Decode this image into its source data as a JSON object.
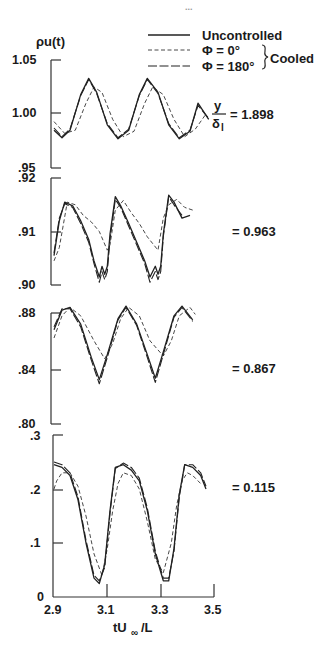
{
  "chart_data": {
    "type": "line",
    "page_mark": "...",
    "ylabel": "ρu(t)",
    "xlabel": "tU∞ /L",
    "x_ticks": [
      "2.9",
      "3.1",
      "3.3",
      "3.5"
    ],
    "xlim": [
      2.9,
      3.5
    ],
    "legend": {
      "items": [
        {
          "label": "Uncontrolled",
          "style": "solid"
        },
        {
          "label": "Φ = 0°",
          "style": "dashed"
        },
        {
          "label": "Φ = 180°",
          "style": "long-dash"
        }
      ],
      "group_label": "Cooled",
      "position": "top-right"
    },
    "panels": [
      {
        "annotation_prefix": "y/δ₁",
        "annotation": "= 1.898",
        "y_ticks": [
          "1.05",
          "1.00",
          ".95"
        ],
        "ylim": [
          0.95,
          1.05
        ],
        "series": [
          {
            "name": "Uncontrolled",
            "x": [
              2.9,
              2.93,
              2.96,
              3.0,
              3.03,
              3.06,
              3.1,
              3.14,
              3.18,
              3.22,
              3.25,
              3.29,
              3.33,
              3.37,
              3.41,
              3.44,
              3.48
            ],
            "y": [
              0.985,
              0.978,
              0.985,
              1.018,
              1.033,
              1.02,
              0.99,
              0.977,
              0.985,
              1.018,
              1.033,
              1.02,
              0.99,
              0.977,
              0.984,
              1.01,
              0.995
            ]
          },
          {
            "name": "Cooled Φ=0°",
            "x": [
              2.9,
              2.94,
              2.98,
              3.02,
              3.05,
              3.08,
              3.12,
              3.16,
              3.2,
              3.24,
              3.27,
              3.31,
              3.35,
              3.39,
              3.43,
              3.47
            ],
            "y": [
              0.993,
              0.982,
              0.985,
              1.01,
              1.025,
              1.02,
              0.995,
              0.979,
              0.984,
              1.01,
              1.025,
              1.018,
              0.995,
              0.979,
              0.986,
              1.0
            ]
          },
          {
            "name": "Cooled Φ=180°",
            "x": [
              2.9,
              2.93,
              2.96,
              3.0,
              3.03,
              3.06,
              3.1,
              3.14,
              3.18,
              3.22,
              3.25,
              3.29,
              3.33,
              3.37,
              3.41,
              3.44,
              3.48
            ],
            "y": [
              0.987,
              0.979,
              0.986,
              1.017,
              1.032,
              1.019,
              0.991,
              0.978,
              0.986,
              1.017,
              1.032,
              1.019,
              0.991,
              0.978,
              0.985,
              1.008,
              0.996
            ]
          }
        ]
      },
      {
        "annotation": "= 0.963",
        "y_ticks": [
          ".92",
          ".91",
          ".90"
        ],
        "ylim": [
          0.9,
          0.92
        ],
        "series": [
          {
            "name": "Uncontrolled",
            "x": [
              2.9,
              2.92,
              2.94,
              2.97,
              3.0,
              3.03,
              3.05,
              3.07,
              3.08,
              3.09,
              3.1,
              3.11,
              3.13,
              3.15,
              3.18,
              3.21,
              3.24,
              3.26,
              3.28,
              3.29,
              3.3,
              3.31,
              3.33,
              3.35,
              3.38,
              3.41
            ],
            "y": [
              0.9055,
              0.912,
              0.9155,
              0.9148,
              0.912,
              0.9085,
              0.9045,
              0.9015,
              0.9035,
              0.902,
              0.9035,
              0.9095,
              0.9165,
              0.9148,
              0.9115,
              0.908,
              0.9045,
              0.9015,
              0.9035,
              0.902,
              0.9035,
              0.9095,
              0.9168,
              0.9155,
              0.9125,
              0.913
            ]
          },
          {
            "name": "Cooled Φ=0°",
            "x": [
              2.9,
              2.92,
              2.95,
              2.98,
              3.01,
              3.04,
              3.07,
              3.1,
              3.11,
              3.13,
              3.16,
              3.19,
              3.22,
              3.25,
              3.29,
              3.31,
              3.33,
              3.36,
              3.39,
              3.42
            ],
            "y": [
              0.9045,
              0.907,
              0.9155,
              0.915,
              0.913,
              0.9118,
              0.91,
              0.9065,
              0.9075,
              0.914,
              0.9158,
              0.9135,
              0.9115,
              0.909,
              0.9065,
              0.9125,
              0.915,
              0.916,
              0.9145,
              0.914
            ]
          },
          {
            "name": "Cooled Φ=180°",
            "x": [
              2.9,
              2.92,
              2.94,
              2.97,
              3.0,
              3.03,
              3.05,
              3.07,
              3.08,
              3.09,
              3.1,
              3.11,
              3.13,
              3.15,
              3.18,
              3.21,
              3.24,
              3.26,
              3.28,
              3.29,
              3.3,
              3.31,
              3.33,
              3.35,
              3.38
            ],
            "y": [
              0.906,
              0.9125,
              0.9152,
              0.9145,
              0.9115,
              0.908,
              0.904,
              0.9005,
              0.9025,
              0.901,
              0.9025,
              0.9085,
              0.916,
              0.9145,
              0.911,
              0.9075,
              0.904,
              0.9005,
              0.9025,
              0.901,
              0.9025,
              0.909,
              0.9165,
              0.915,
              0.913
            ]
          }
        ]
      },
      {
        "annotation": "= 0.867",
        "y_ticks": [
          ".88",
          ".84",
          ".80"
        ],
        "ylim": [
          0.8,
          0.88
        ],
        "series": [
          {
            "name": "Uncontrolled",
            "x": [
              2.9,
              2.93,
              2.96,
              3.0,
              3.04,
              3.07,
              3.1,
              3.14,
              3.17,
              3.21,
              3.25,
              3.28,
              3.31,
              3.35,
              3.38,
              3.42
            ],
            "y": [
              0.868,
              0.882,
              0.884,
              0.872,
              0.848,
              0.832,
              0.85,
              0.876,
              0.885,
              0.872,
              0.85,
              0.833,
              0.852,
              0.878,
              0.885,
              0.875
            ]
          },
          {
            "name": "Cooled Φ=0°",
            "x": [
              2.9,
              2.93,
              2.96,
              3.0,
              3.05,
              3.09,
              3.12,
              3.15,
              3.18,
              3.22,
              3.26,
              3.31,
              3.34,
              3.37,
              3.41,
              3.43
            ],
            "y": [
              0.862,
              0.878,
              0.884,
              0.878,
              0.86,
              0.847,
              0.858,
              0.876,
              0.884,
              0.878,
              0.86,
              0.849,
              0.86,
              0.878,
              0.884,
              0.879
            ]
          },
          {
            "name": "Cooled Φ=180°",
            "x": [
              2.9,
              2.93,
              2.96,
              3.0,
              3.04,
              3.07,
              3.1,
              3.14,
              3.17,
              3.21,
              3.25,
              3.28,
              3.31,
              3.35,
              3.38,
              3.42
            ],
            "y": [
              0.87,
              0.883,
              0.883,
              0.87,
              0.846,
              0.829,
              0.848,
              0.875,
              0.884,
              0.871,
              0.848,
              0.83,
              0.85,
              0.877,
              0.884,
              0.874
            ]
          }
        ]
      },
      {
        "annotation": "= 0.115",
        "y_ticks": [
          ".3",
          ".2",
          ".1",
          "0"
        ],
        "ylim": [
          0.0,
          0.3
        ],
        "series": [
          {
            "name": "Uncontrolled",
            "x": [
              2.9,
              2.93,
              2.96,
              2.99,
              3.02,
              3.05,
              3.07,
              3.09,
              3.11,
              3.13,
              3.16,
              3.19,
              3.22,
              3.25,
              3.28,
              3.31,
              3.33,
              3.35,
              3.37,
              3.39,
              3.42,
              3.45,
              3.47
            ],
            "y": [
              0.245,
              0.24,
              0.225,
              0.18,
              0.1,
              0.035,
              0.025,
              0.06,
              0.16,
              0.24,
              0.245,
              0.235,
              0.215,
              0.16,
              0.08,
              0.03,
              0.03,
              0.09,
              0.19,
              0.245,
              0.24,
              0.225,
              0.2
            ]
          },
          {
            "name": "Cooled Φ=0°",
            "x": [
              2.9,
              2.91,
              2.93,
              2.96,
              2.99,
              3.02,
              3.05,
              3.08,
              3.1,
              3.12,
              3.14,
              3.16,
              3.19,
              3.22,
              3.25,
              3.28,
              3.31,
              3.34,
              3.36,
              3.38,
              3.4,
              3.42,
              3.45
            ],
            "y": [
              0.2,
              0.215,
              0.23,
              0.23,
              0.205,
              0.15,
              0.08,
              0.04,
              0.09,
              0.16,
              0.21,
              0.23,
              0.225,
              0.2,
              0.14,
              0.07,
              0.045,
              0.1,
              0.17,
              0.215,
              0.23,
              0.225,
              0.21
            ]
          },
          {
            "name": "Cooled Φ=180°",
            "x": [
              2.9,
              2.93,
              2.96,
              2.99,
              3.02,
              3.05,
              3.07,
              3.09,
              3.11,
              3.13,
              3.16,
              3.19,
              3.22,
              3.25,
              3.28,
              3.31,
              3.33,
              3.35,
              3.37,
              3.39,
              3.42,
              3.45,
              3.47
            ],
            "y": [
              0.25,
              0.245,
              0.23,
              0.185,
              0.105,
              0.04,
              0.03,
              0.055,
              0.155,
              0.238,
              0.248,
              0.24,
              0.22,
              0.165,
              0.085,
              0.035,
              0.035,
              0.085,
              0.185,
              0.245,
              0.245,
              0.23,
              0.205
            ]
          }
        ]
      }
    ],
    "grid": false
  },
  "labels": {
    "page_mark": "...",
    "ylabel": "ρu(t)",
    "xlabel_main": "tU",
    "xlabel_sub": "∞",
    "xlabel_rest": " /L",
    "legend_uncontrolled": "Uncontrolled",
    "legend_phi0": "Φ = 0°",
    "legend_phi180": "Φ = 180°",
    "legend_group": "Cooled",
    "frac_num": "y",
    "frac_den": "δ",
    "frac_den_sub": "l",
    "ann1": "= 1.898",
    "ann2": "= 0.963",
    "ann3": "= 0.867",
    "ann4": "= 0.115",
    "xt0": "2.9",
    "xt1": "3.1",
    "xt2": "3.3",
    "xt3": "3.5",
    "p1t0": "1.05",
    "p1t1": "1.00",
    "p1t2": ".95",
    "p2t0": ".92",
    "p2t1": ".91",
    "p2t2": ".90",
    "p3t0": ".88",
    "p3t1": ".84",
    "p3t2": ".80",
    "p4t0": ".3",
    "p4t1": ".2",
    "p4t2": ".1",
    "p4t3": "0"
  }
}
